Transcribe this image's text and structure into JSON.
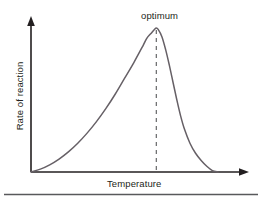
{
  "figure": {
    "name": "enzyme-rate-vs-temperature-graph",
    "background_color": "#ffffff",
    "curve_color": "#666066",
    "axis_color": "#231f20",
    "text_color": "#231f20",
    "divider_color": "#58595b"
  },
  "labels": {
    "optimum": "optimum",
    "x_axis": "Temperature",
    "y_axis": "Rate of reaction"
  },
  "chart_data": {
    "type": "line",
    "title": "",
    "subtitle": "",
    "xlabel": "Temperature",
    "ylabel": "Rate of reaction",
    "xlim": [
      0,
      100
    ],
    "ylim": [
      0,
      100
    ],
    "grid": false,
    "legend": null,
    "axes_style": "arrowed-L-axes",
    "tick_labels_x": [],
    "tick_labels_y": [],
    "annotations": [
      {
        "text": "optimum",
        "x": 67,
        "y": 100,
        "marker": "dashed-vertical-line-from-peak-to-x-axis"
      }
    ],
    "series": [
      {
        "name": "Rate of reaction",
        "color": "#666066",
        "x": [
          0,
          5,
          10,
          15,
          20,
          25,
          30,
          35,
          40,
          45,
          50,
          55,
          60,
          62,
          64,
          66,
          67,
          68,
          70,
          72,
          74,
          76,
          78,
          80,
          82,
          85,
          88,
          91,
          94,
          97,
          100
        ],
        "y": [
          0,
          2,
          5,
          9,
          14,
          20,
          27,
          35,
          44,
          54,
          65,
          76,
          88,
          93,
          96,
          99,
          100,
          99,
          94,
          85,
          74,
          62,
          50,
          39,
          30,
          20,
          13,
          8,
          4,
          1,
          0
        ]
      }
    ]
  }
}
